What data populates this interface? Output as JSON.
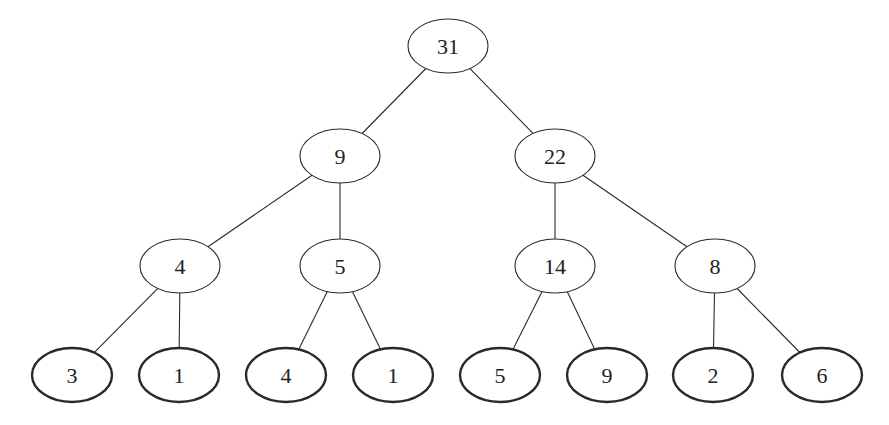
{
  "diagram": {
    "type": "binary-tree",
    "colors": {
      "background": "#ffffff",
      "stroke": "#2a2a2a",
      "text": "#222222"
    },
    "nodes": [
      {
        "id": "n0",
        "label": "31",
        "level": 0,
        "cx": 448,
        "cy": 46,
        "leaf": false
      },
      {
        "id": "n1",
        "label": "9",
        "level": 1,
        "cx": 340,
        "cy": 156,
        "leaf": false
      },
      {
        "id": "n2",
        "label": "22",
        "level": 1,
        "cx": 555,
        "cy": 156,
        "leaf": false
      },
      {
        "id": "n3",
        "label": "4",
        "level": 2,
        "cx": 180,
        "cy": 266,
        "leaf": false
      },
      {
        "id": "n4",
        "label": "5",
        "level": 2,
        "cx": 340,
        "cy": 266,
        "leaf": false
      },
      {
        "id": "n5",
        "label": "14",
        "level": 2,
        "cx": 555,
        "cy": 266,
        "leaf": false
      },
      {
        "id": "n6",
        "label": "8",
        "level": 2,
        "cx": 715,
        "cy": 266,
        "leaf": false
      },
      {
        "id": "n7",
        "label": "3",
        "level": 3,
        "cx": 72,
        "cy": 375,
        "leaf": true
      },
      {
        "id": "n8",
        "label": "1",
        "level": 3,
        "cx": 179,
        "cy": 375,
        "leaf": true
      },
      {
        "id": "n9",
        "label": "4",
        "level": 3,
        "cx": 286,
        "cy": 375,
        "leaf": true
      },
      {
        "id": "n10",
        "label": "1",
        "level": 3,
        "cx": 393,
        "cy": 375,
        "leaf": true
      },
      {
        "id": "n11",
        "label": "5",
        "level": 3,
        "cx": 500,
        "cy": 375,
        "leaf": true
      },
      {
        "id": "n12",
        "label": "9",
        "level": 3,
        "cx": 607,
        "cy": 375,
        "leaf": true
      },
      {
        "id": "n13",
        "label": "2",
        "level": 3,
        "cx": 713,
        "cy": 375,
        "leaf": true
      },
      {
        "id": "n14",
        "label": "6",
        "level": 3,
        "cx": 822,
        "cy": 375,
        "leaf": true
      }
    ],
    "edges": [
      {
        "from": "n0",
        "to": "n1"
      },
      {
        "from": "n0",
        "to": "n2"
      },
      {
        "from": "n1",
        "to": "n3"
      },
      {
        "from": "n1",
        "to": "n4"
      },
      {
        "from": "n2",
        "to": "n5"
      },
      {
        "from": "n2",
        "to": "n6"
      },
      {
        "from": "n3",
        "to": "n7"
      },
      {
        "from": "n3",
        "to": "n8"
      },
      {
        "from": "n4",
        "to": "n9"
      },
      {
        "from": "n4",
        "to": "n10"
      },
      {
        "from": "n5",
        "to": "n11"
      },
      {
        "from": "n5",
        "to": "n12"
      },
      {
        "from": "n6",
        "to": "n13"
      },
      {
        "from": "n6",
        "to": "n14"
      }
    ]
  }
}
